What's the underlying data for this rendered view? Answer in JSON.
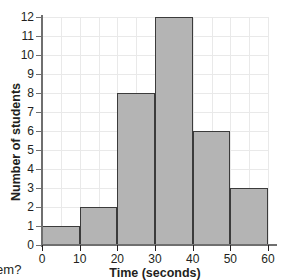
{
  "page": {
    "clipped_top_text": "",
    "clipped_bottom_text": "blem?"
  },
  "chart_data": {
    "type": "bar",
    "title": "",
    "xlabel": "Time (seconds)",
    "ylabel": "Number of students",
    "categories": [
      "0–10",
      "10–20",
      "20–30",
      "30–40",
      "40–50",
      "50–60"
    ],
    "bin_edges": [
      0,
      10,
      20,
      30,
      40,
      50,
      60
    ],
    "values": [
      1,
      2,
      8,
      12,
      6,
      3
    ],
    "xlim": [
      0,
      60
    ],
    "ylim": [
      0,
      12
    ],
    "x_ticks": [
      "0",
      "10",
      "20",
      "30",
      "40",
      "50",
      "60"
    ],
    "y_ticks": [
      "0",
      "1",
      "2",
      "3",
      "4",
      "5",
      "6",
      "7",
      "8",
      "9",
      "10",
      "11",
      "12"
    ],
    "grid": true,
    "grid_x_step": 5,
    "grid_y_step": 1,
    "legend": null,
    "colors": {
      "bar_fill": "#b4b4b4",
      "bar_stroke": "#3b3b3b",
      "gridline": "#e9e9e9",
      "axis": "#6f6f6f",
      "text": "#231f20",
      "background": "#ffffff"
    }
  }
}
